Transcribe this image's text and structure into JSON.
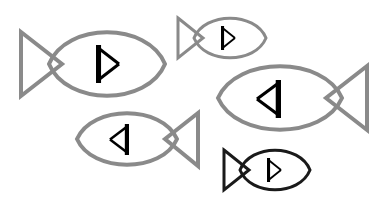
{
  "figure": {
    "background_color": "#ffffff",
    "width": 387,
    "height": 203,
    "palette": {
      "gray_stroke": "#8a8a8a",
      "black_stroke": "#1a1a1a",
      "glyph_color": "#000000",
      "background": "#ffffff"
    },
    "glyph_description": "Open triangle rune: thick vertical bar with two thin diagonals meeting at a point",
    "shapes": [
      {
        "id": "fish-1",
        "label": "Large gray fish facing right",
        "color": "#8a8a8a",
        "stroke_width": 4,
        "direction": "right",
        "size": "large",
        "glyph": "right",
        "bbox": [
          21,
          32,
          144,
          64
        ],
        "body": {
          "cx": 107,
          "cy": 64,
          "rx": 58,
          "ry": 32
        },
        "tail": {
          "x_outer": 21,
          "x_inner": 62,
          "y_top": 32,
          "y_bottom": 96,
          "pinch": 64
        },
        "glyph_box": {
          "x": 96,
          "y": 45,
          "w": 23,
          "h": 38
        }
      },
      {
        "id": "fish-2",
        "label": "Small gray fish facing right",
        "color": "#8a8a8a",
        "stroke_width": 3,
        "direction": "right",
        "size": "small",
        "glyph": "right",
        "bbox": [
          178,
          18,
          87,
          40
        ],
        "body": {
          "cx": 230,
          "cy": 38,
          "rx": 36,
          "ry": 20
        },
        "tail": {
          "x_outer": 178,
          "x_inner": 203,
          "y_top": 18,
          "y_bottom": 58,
          "pinch": 38
        },
        "glyph_box": {
          "x": 221,
          "y": 26,
          "w": 14,
          "h": 24
        }
      },
      {
        "id": "fish-3",
        "label": "Large gray fish facing left",
        "color": "#8a8a8a",
        "stroke_width": 4,
        "direction": "left",
        "size": "large",
        "glyph": "left",
        "bbox": [
          218,
          66,
          149,
          64
        ],
        "body": {
          "cx": 280,
          "cy": 98,
          "rx": 62,
          "ry": 32
        },
        "tail": {
          "x_outer": 367,
          "x_inner": 326,
          "y_top": 66,
          "y_bottom": 130,
          "pinch": 98
        },
        "glyph_box": {
          "x": 257,
          "y": 80,
          "w": 24,
          "h": 38
        }
      },
      {
        "id": "fish-4",
        "label": "Medium gray fish facing left",
        "color": "#8a8a8a",
        "stroke_width": 4,
        "direction": "left",
        "size": "medium",
        "glyph": "left",
        "bbox": [
          77,
          113,
          121,
          53
        ],
        "body": {
          "cx": 127,
          "cy": 139,
          "rx": 50,
          "ry": 26
        },
        "tail": {
          "x_outer": 198,
          "x_inner": 165,
          "y_top": 113,
          "y_bottom": 166,
          "pinch": 139
        },
        "glyph_box": {
          "x": 110,
          "y": 124,
          "w": 19,
          "h": 31
        }
      },
      {
        "id": "fish-5",
        "label": "Small black fish facing right",
        "color": "#1a1a1a",
        "stroke_width": 3,
        "direction": "right",
        "size": "small",
        "glyph": "right",
        "bbox": [
          224,
          150,
          86,
          40
        ],
        "body": {
          "cx": 275,
          "cy": 170,
          "rx": 35,
          "ry": 20
        },
        "tail": {
          "x_outer": 224,
          "x_inner": 249,
          "y_top": 150,
          "y_bottom": 190,
          "pinch": 170
        },
        "glyph_box": {
          "x": 267,
          "y": 158,
          "w": 14,
          "h": 24
        }
      }
    ]
  }
}
